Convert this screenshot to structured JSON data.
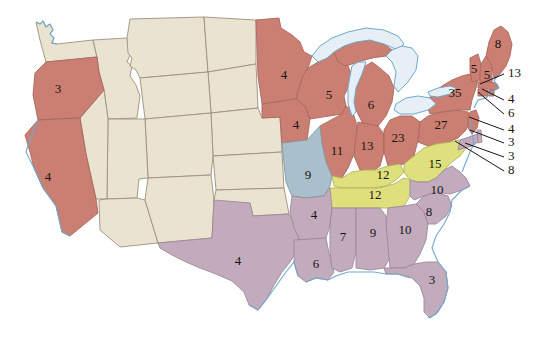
{
  "map": {
    "title": "United States Electoral Vote Map",
    "legend_colors": {
      "red": "#cb7f72",
      "beige": "#e9e3cf",
      "purple": "#c3abbe",
      "yellow": "#dde07c",
      "blue": "#a9bfcb",
      "lake": "#e6eff5",
      "coastline": "#6fa8cf",
      "background": "#ffffff",
      "label_text": "#1a1410"
    }
  },
  "chart_data": {
    "type": "map",
    "subtitle": "",
    "value_label": "Electoral votes",
    "grid": false,
    "legend": "none",
    "groups": [
      {
        "key": "red",
        "color": "#cb7f72",
        "name": "Red group"
      },
      {
        "key": "beige",
        "color": "#e9e3cf",
        "name": "Beige group (unlabeled)"
      },
      {
        "key": "purple",
        "color": "#c3abbe",
        "name": "Purple group"
      },
      {
        "key": "yellow",
        "color": "#dde07c",
        "name": "Yellow group"
      },
      {
        "key": "blue",
        "color": "#a9bfcb",
        "name": "Blue group"
      }
    ],
    "categories": [
      "Oregon",
      "California",
      "Minnesota",
      "Iowa",
      "Wisconsin",
      "Michigan",
      "Illinois",
      "Indiana",
      "Ohio",
      "Pennsylvania",
      "New York",
      "Vermont",
      "New Hampshire",
      "Maine",
      "Massachusetts",
      "Rhode Island",
      "Connecticut",
      "New Jersey",
      "Delaware",
      "District of Columbia",
      "Maryland",
      "Virginia",
      "Kentucky",
      "Tennessee",
      "North Carolina",
      "South Carolina",
      "Georgia",
      "Florida",
      "Alabama",
      "Mississippi",
      "Louisiana",
      "Arkansas",
      "Texas",
      "Missouri"
    ],
    "values": [
      3,
      4,
      4,
      4,
      5,
      6,
      11,
      13,
      23,
      27,
      35,
      5,
      5,
      8,
      13,
      4,
      6,
      4,
      3,
      3,
      8,
      15,
      12,
      12,
      10,
      8,
      10,
      3,
      9,
      7,
      6,
      4,
      4,
      9
    ],
    "unlabeled_states": [
      "Washington",
      "Idaho",
      "Montana",
      "Wyoming",
      "North Dakota",
      "South Dakota",
      "Nebraska",
      "Kansas",
      "Colorado",
      "Utah",
      "Nevada",
      "Arizona",
      "New Mexico",
      "Oklahoma"
    ]
  },
  "states": [
    {
      "id": "WA",
      "name": "Washington",
      "group": "beige",
      "label": "",
      "lx": 0,
      "ly": 0
    },
    {
      "id": "OR",
      "name": "Oregon",
      "group": "red",
      "label": "3",
      "lx": 58,
      "ly": 90
    },
    {
      "id": "CA",
      "name": "California",
      "group": "red",
      "label": "4",
      "lx": 48,
      "ly": 178
    },
    {
      "id": "ID",
      "name": "Idaho",
      "group": "beige",
      "label": "",
      "lx": 0,
      "ly": 0
    },
    {
      "id": "NV",
      "name": "Nevada",
      "group": "beige",
      "label": "",
      "lx": 0,
      "ly": 0
    },
    {
      "id": "MT",
      "name": "Montana",
      "group": "beige",
      "label": "",
      "lx": 0,
      "ly": 0
    },
    {
      "id": "WY",
      "name": "Wyoming",
      "group": "beige",
      "label": "",
      "lx": 0,
      "ly": 0
    },
    {
      "id": "UT",
      "name": "Utah",
      "group": "beige",
      "label": "",
      "lx": 0,
      "ly": 0
    },
    {
      "id": "AZ",
      "name": "Arizona",
      "group": "beige",
      "label": "",
      "lx": 0,
      "ly": 0
    },
    {
      "id": "CO",
      "name": "Colorado",
      "group": "beige",
      "label": "",
      "lx": 0,
      "ly": 0
    },
    {
      "id": "NM",
      "name": "New Mexico",
      "group": "beige",
      "label": "",
      "lx": 0,
      "ly": 0
    },
    {
      "id": "ND",
      "name": "North Dakota",
      "group": "beige",
      "label": "",
      "lx": 0,
      "ly": 0
    },
    {
      "id": "SD",
      "name": "South Dakota",
      "group": "beige",
      "label": "",
      "lx": 0,
      "ly": 0
    },
    {
      "id": "NE",
      "name": "Nebraska",
      "group": "beige",
      "label": "",
      "lx": 0,
      "ly": 0
    },
    {
      "id": "KS",
      "name": "Kansas",
      "group": "beige",
      "label": "",
      "lx": 0,
      "ly": 0
    },
    {
      "id": "OK",
      "name": "Oklahoma",
      "group": "beige",
      "label": "",
      "lx": 0,
      "ly": 0
    },
    {
      "id": "TX",
      "name": "Texas",
      "group": "purple",
      "label": "4",
      "lx": 238,
      "ly": 262
    },
    {
      "id": "MN",
      "name": "Minnesota",
      "group": "red",
      "label": "4",
      "lx": 284,
      "ly": 76
    },
    {
      "id": "IA",
      "name": "Iowa",
      "group": "red",
      "label": "4",
      "lx": 296,
      "ly": 126
    },
    {
      "id": "WI",
      "name": "Wisconsin",
      "group": "red",
      "label": "5",
      "lx": 329,
      "ly": 96
    },
    {
      "id": "MI",
      "name": "Michigan",
      "group": "red",
      "label": "6",
      "lx": 371,
      "ly": 106
    },
    {
      "id": "MO",
      "name": "Missouri",
      "group": "blue",
      "label": "9",
      "lx": 308,
      "ly": 176
    },
    {
      "id": "IL",
      "name": "Illinois",
      "group": "red",
      "label": "11",
      "lx": 337,
      "ly": 152
    },
    {
      "id": "IN",
      "name": "Indiana",
      "group": "red",
      "label": "13",
      "lx": 367,
      "ly": 147
    },
    {
      "id": "OH",
      "name": "Ohio",
      "group": "red",
      "label": "23",
      "lx": 398,
      "ly": 139
    },
    {
      "id": "PA",
      "name": "Pennsylvania",
      "group": "red",
      "label": "27",
      "lx": 441,
      "ly": 126
    },
    {
      "id": "NY",
      "name": "New York",
      "group": "red",
      "label": "35",
      "lx": 455,
      "ly": 94
    },
    {
      "id": "VT",
      "name": "Vermont",
      "group": "red",
      "label": "5",
      "lx": 474,
      "ly": 70
    },
    {
      "id": "NH",
      "name": "New Hampshire",
      "group": "red",
      "label": "5",
      "lx": 487,
      "ly": 76
    },
    {
      "id": "ME",
      "name": "Maine",
      "group": "red",
      "label": "8",
      "lx": 498,
      "ly": 45
    },
    {
      "id": "KY",
      "name": "Kentucky",
      "group": "yellow",
      "label": "12",
      "lx": 383,
      "ly": 176
    },
    {
      "id": "TN",
      "name": "Tennessee",
      "group": "yellow",
      "label": "12",
      "lx": 375,
      "ly": 196
    },
    {
      "id": "VA",
      "name": "Virginia",
      "group": "yellow",
      "label": "15",
      "lx": 435,
      "ly": 165
    },
    {
      "id": "NC",
      "name": "North Carolina",
      "group": "purple",
      "label": "10",
      "lx": 437,
      "ly": 191
    },
    {
      "id": "SC",
      "name": "South Carolina",
      "group": "purple",
      "label": "8",
      "lx": 429,
      "ly": 213
    },
    {
      "id": "GA",
      "name": "Georgia",
      "group": "purple",
      "label": "10",
      "lx": 405,
      "ly": 231
    },
    {
      "id": "FL",
      "name": "Florida",
      "group": "purple",
      "label": "3",
      "lx": 432,
      "ly": 281
    },
    {
      "id": "AL",
      "name": "Alabama",
      "group": "purple",
      "label": "9",
      "lx": 373,
      "ly": 234
    },
    {
      "id": "MS",
      "name": "Mississippi",
      "group": "purple",
      "label": "7",
      "lx": 343,
      "ly": 238
    },
    {
      "id": "LA",
      "name": "Louisiana",
      "group": "purple",
      "label": "6",
      "lx": 316,
      "ly": 265
    },
    {
      "id": "AR",
      "name": "Arkansas",
      "group": "purple",
      "label": "4",
      "lx": 314,
      "ly": 216
    }
  ],
  "callouts": [
    {
      "id": "MA",
      "name": "Massachusetts",
      "label": "13",
      "tx": 508,
      "ty": 74,
      "px": 480,
      "py": 84
    },
    {
      "id": "RI",
      "name": "Rhode Island",
      "label": "4",
      "tx": 508,
      "ty": 100,
      "px": 482,
      "py": 89
    },
    {
      "id": "CT",
      "name": "Connecticut",
      "label": "6",
      "tx": 508,
      "ty": 114,
      "px": 478,
      "py": 92
    },
    {
      "id": "NJ",
      "name": "New Jersey",
      "label": "4",
      "tx": 508,
      "ty": 130,
      "px": 469,
      "py": 117
    },
    {
      "id": "DE",
      "name": "Delaware",
      "label": "3",
      "tx": 508,
      "ty": 143,
      "px": 470,
      "py": 130
    },
    {
      "id": "DC",
      "name": "District of Columbia",
      "label": "3",
      "tx": 508,
      "ty": 157,
      "px": 465,
      "py": 143
    },
    {
      "id": "MD",
      "name": "Maryland",
      "label": "8",
      "tx": 508,
      "ty": 171,
      "px": 455,
      "py": 141
    }
  ]
}
